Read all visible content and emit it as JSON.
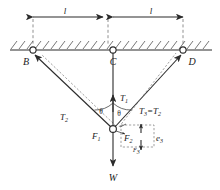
{
  "figure": {
    "name": "cable-suspension-free-body-diagram"
  },
  "dimensions": {
    "left_label": "l",
    "right_label": "l"
  },
  "supports": {
    "left_label": "B",
    "center_label": "C",
    "right_label": "D"
  },
  "tensions": {
    "vertical": "T",
    "vertical_sub": "1",
    "left": "T",
    "left_sub": "2",
    "right_combined": "T",
    "right_sub": "3",
    "right_equals": "=",
    "right_equals_sym": "T",
    "right_equals_sub": "2"
  },
  "angles": {
    "left_label": "θ",
    "right_label": "θ"
  },
  "forces": {
    "f1": "F",
    "f1_sub": "1",
    "f2": "F",
    "f2_sub": "2",
    "f3": "F",
    "f3_sub": "3",
    "weight": "W"
  },
  "basis": {
    "e3": "e",
    "e3_sub": "3"
  },
  "colors": {
    "ink": "#2b2b2b",
    "ink_light": "#6b6b6b",
    "hatch": "#4a4a4a",
    "background": "#ffffff"
  }
}
